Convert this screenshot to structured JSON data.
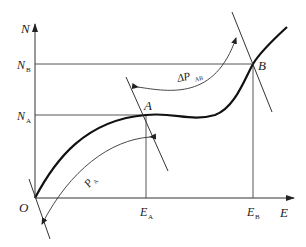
{
  "diagram": {
    "type": "curve-with-tangents",
    "axes": {
      "y_label": "N",
      "x_label": "E",
      "origin_label": "O"
    },
    "y_ticks": [
      {
        "main": "N",
        "sub": "B"
      },
      {
        "main": "N",
        "sub": "A"
      }
    ],
    "x_ticks": [
      {
        "main": "E",
        "sub": "A"
      },
      {
        "main": "E",
        "sub": "B"
      }
    ],
    "points": [
      {
        "label": "A"
      },
      {
        "label": "B"
      }
    ],
    "arrows": [
      {
        "main": "P",
        "sub": "A"
      },
      {
        "main": "ΔP",
        "sub": "AB"
      }
    ],
    "colors": {
      "line": "#333333",
      "curve": "#111111",
      "background": "#ffffff"
    }
  }
}
